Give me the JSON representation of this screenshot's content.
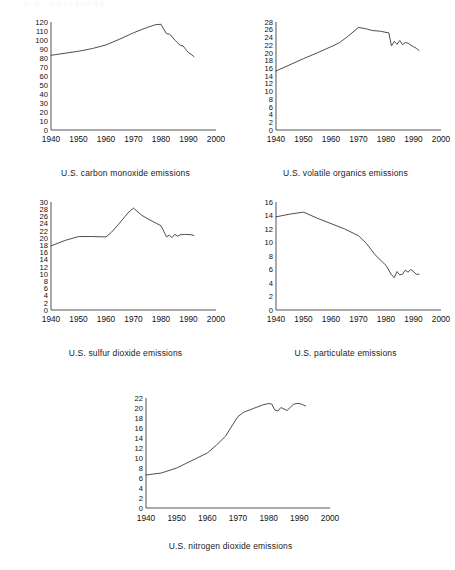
{
  "page": {
    "background": "#ffffff",
    "line_color": "#3a3a3a",
    "axis_color": "#555555",
    "text_color": "#111111",
    "faint_header": "U.S. EMISSIONS"
  },
  "chart_data": [
    {
      "id": "carbon-monoxide",
      "type": "line",
      "title": "U.S. carbon monoxide emissions",
      "xlabel": "",
      "ylabel": "",
      "xlim": [
        1940,
        2000
      ],
      "ylim": [
        0,
        120
      ],
      "grid": false,
      "legend": false,
      "xticks": [
        1940,
        1950,
        1960,
        1970,
        1980,
        1990,
        2000
      ],
      "yticks": [
        0,
        10,
        20,
        30,
        40,
        50,
        60,
        70,
        80,
        90,
        100,
        110,
        120
      ],
      "x": [
        1940,
        1950,
        1955,
        1960,
        1965,
        1970,
        1975,
        1978,
        1980,
        1981,
        1982,
        1983,
        1984,
        1985,
        1986,
        1987,
        1988,
        1989,
        1990,
        1991,
        1992
      ],
      "values": [
        83.0,
        87.5,
        90.5,
        94.5,
        101.0,
        108.0,
        114.0,
        117.0,
        117.5,
        112.0,
        107.0,
        106.5,
        104.0,
        100.0,
        97.0,
        94.0,
        93.5,
        89.5,
        86.0,
        84.0,
        81.5
      ]
    },
    {
      "id": "volatile-organics",
      "type": "line",
      "title": "U.S. volatile organics emissions",
      "xlabel": "",
      "ylabel": "",
      "xlim": [
        1940,
        2000
      ],
      "ylim": [
        0,
        28
      ],
      "grid": false,
      "legend": false,
      "xticks": [
        1940,
        1950,
        1960,
        1970,
        1980,
        1990,
        2000
      ],
      "yticks": [
        0,
        2,
        4,
        6,
        8,
        10,
        12,
        14,
        16,
        18,
        20,
        22,
        24,
        26,
        28
      ],
      "x": [
        1940,
        1950,
        1955,
        1960,
        1963,
        1966,
        1970,
        1973,
        1975,
        1978,
        1980,
        1981,
        1982,
        1983,
        1984,
        1985,
        1986,
        1987,
        1988,
        1989,
        1990,
        1991,
        1992
      ],
      "values": [
        15.3,
        18.5,
        20.0,
        21.6,
        22.6,
        24.2,
        26.6,
        26.2,
        25.8,
        25.6,
        25.3,
        25.2,
        21.8,
        23.0,
        22.2,
        23.2,
        22.1,
        22.7,
        22.5,
        22.0,
        21.6,
        21.2,
        20.6
      ]
    },
    {
      "id": "sulfur-dioxide",
      "type": "line",
      "title": "U.S. sulfur dioxide emissions",
      "xlabel": "",
      "ylabel": "",
      "xlim": [
        1940,
        2000
      ],
      "ylim": [
        0,
        30
      ],
      "grid": false,
      "legend": false,
      "xticks": [
        1940,
        1950,
        1960,
        1970,
        1980,
        1990,
        2000
      ],
      "yticks": [
        0,
        2,
        4,
        6,
        8,
        10,
        12,
        14,
        16,
        18,
        20,
        22,
        24,
        26,
        28,
        30
      ],
      "x": [
        1940,
        1945,
        1950,
        1955,
        1960,
        1962,
        1965,
        1968,
        1970,
        1973,
        1976,
        1980,
        1982,
        1983,
        1984,
        1985,
        1986,
        1987,
        1989,
        1991,
        1992
      ],
      "values": [
        17.8,
        19.3,
        20.4,
        20.4,
        20.3,
        21.6,
        24.2,
        27.0,
        28.3,
        26.3,
        25.0,
        23.4,
        20.3,
        20.8,
        20.1,
        21.0,
        20.5,
        20.9,
        21.0,
        20.9,
        20.7
      ]
    },
    {
      "id": "particulate",
      "type": "line",
      "title": "U.S. particulate emissions",
      "xlabel": "",
      "ylabel": "",
      "xlim": [
        1940,
        2000
      ],
      "ylim": [
        0,
        16
      ],
      "grid": false,
      "legend": false,
      "xticks": [
        1940,
        1950,
        1960,
        1970,
        1980,
        1990,
        2000
      ],
      "yticks": [
        0,
        2,
        4,
        6,
        8,
        10,
        12,
        14,
        16
      ],
      "x": [
        1940,
        1945,
        1950,
        1955,
        1960,
        1965,
        1970,
        1973,
        1976,
        1980,
        1982,
        1983,
        1984,
        1985,
        1986,
        1987,
        1988,
        1989,
        1990,
        1991,
        1992
      ],
      "values": [
        13.8,
        14.2,
        14.5,
        13.6,
        12.8,
        12.0,
        11.0,
        9.8,
        8.2,
        6.6,
        5.2,
        4.8,
        5.7,
        5.2,
        5.3,
        5.9,
        5.6,
        6.0,
        5.7,
        5.3,
        5.3
      ]
    },
    {
      "id": "nitrogen-dioxide",
      "type": "line",
      "title": "U.S. nitrogen dioxide emissions",
      "xlabel": "",
      "ylabel": "",
      "xlim": [
        1940,
        2000
      ],
      "ylim": [
        0,
        22
      ],
      "grid": false,
      "legend": false,
      "xticks": [
        1940,
        1950,
        1960,
        1970,
        1980,
        1990,
        2000
      ],
      "yticks": [
        0,
        2,
        4,
        6,
        8,
        10,
        12,
        14,
        16,
        18,
        20,
        22
      ],
      "x": [
        1940,
        1945,
        1950,
        1953,
        1956,
        1960,
        1963,
        1966,
        1968,
        1970,
        1972,
        1975,
        1978,
        1980,
        1981,
        1982,
        1983,
        1984,
        1985,
        1986,
        1987,
        1988,
        1989,
        1990,
        1991,
        1992
      ],
      "values": [
        6.6,
        7.0,
        8.0,
        8.9,
        9.8,
        11.0,
        12.6,
        14.4,
        16.4,
        18.3,
        19.2,
        19.9,
        20.6,
        20.9,
        20.8,
        19.6,
        19.4,
        20.1,
        19.8,
        19.5,
        20.1,
        20.7,
        20.9,
        20.9,
        20.7,
        20.4
      ]
    }
  ]
}
